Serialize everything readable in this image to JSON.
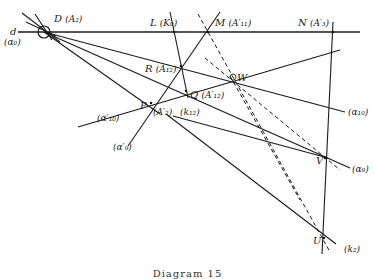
{
  "figure": {
    "caption": "Diagram 15",
    "points": [
      {
        "id": "D",
        "label": "D",
        "alt": "(A₂)",
        "x": 44,
        "y": 32
      },
      {
        "id": "L",
        "label": "L",
        "alt": "(K₀)",
        "x": 174,
        "y": 32
      },
      {
        "id": "M",
        "label": "M",
        "alt": "(A′₁₁)",
        "x": 208,
        "y": 32
      },
      {
        "id": "N",
        "label": "N",
        "alt": "(A′₃)",
        "x": 333,
        "y": 32
      },
      {
        "id": "R",
        "label": "R",
        "alt": "(A₁₂)",
        "x": 181,
        "y": 66
      },
      {
        "id": "W",
        "label": "W",
        "alt": "",
        "x": 233,
        "y": 77
      },
      {
        "id": "Q",
        "label": "Q",
        "alt": "(A′₁₂)",
        "x": 186,
        "y": 91
      },
      {
        "id": "P",
        "label": "P",
        "alt": "(A′₂)",
        "x": 151,
        "y": 103
      },
      {
        "id": "V",
        "label": "V",
        "alt": "",
        "x": 325,
        "y": 158
      },
      {
        "id": "U",
        "label": "U",
        "alt": "",
        "x": 324,
        "y": 238
      }
    ],
    "line_labels": [
      {
        "id": "d",
        "text": "d"
      },
      {
        "id": "a0",
        "text": "(α₀)"
      },
      {
        "id": "k12",
        "text": "(k₁₂)"
      },
      {
        "id": "a10",
        "text": "(α₁₀)"
      },
      {
        "id": "a9",
        "text": "(α₉)"
      },
      {
        "id": "a10p",
        "text": "(α′₁₀)"
      },
      {
        "id": "a9p",
        "text": "(α′₉)"
      },
      {
        "id": "k2",
        "text": "(k₂)"
      }
    ],
    "colors": {
      "ink": "#1a1a1a",
      "background": "#ffffff"
    }
  }
}
